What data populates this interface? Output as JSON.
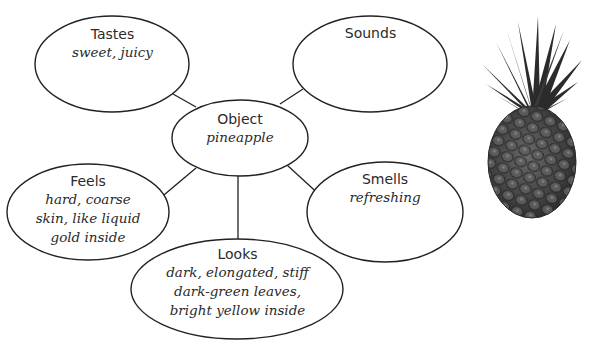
{
  "diagram": {
    "type": "sensory word web",
    "center": {
      "title": "Object",
      "text": "pineapple"
    },
    "nodes": [
      {
        "id": "tastes",
        "title": "Tastes",
        "lines": [
          "sweet, juicy"
        ]
      },
      {
        "id": "sounds",
        "title": "Sounds",
        "lines": []
      },
      {
        "id": "feels",
        "title": "Feels",
        "lines": [
          "hard, coarse",
          "skin, like liquid",
          "gold inside"
        ]
      },
      {
        "id": "smells",
        "title": "Smells",
        "lines": [
          "refreshing"
        ]
      },
      {
        "id": "looks",
        "title": "Looks",
        "lines": [
          "dark, elongated, stiff",
          "dark-green leaves,",
          "bright yellow inside"
        ]
      }
    ],
    "colors": {
      "stroke": "#222222",
      "text": "#2a2a2a",
      "background": "#ffffff"
    }
  },
  "image": {
    "subject": "pineapple-photo",
    "style": "grayscale"
  }
}
